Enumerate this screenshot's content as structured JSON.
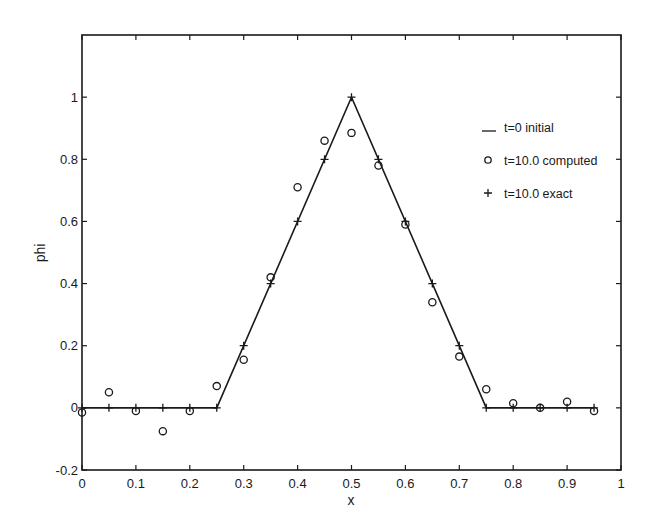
{
  "chart_data": {
    "type": "line",
    "title": "",
    "xlabel": "x",
    "ylabel": "phi",
    "xlim": [
      0,
      1
    ],
    "ylim": [
      -0.2,
      1.2
    ],
    "grid": false,
    "legend_position": "upper right (inside)",
    "x_ticks": [
      0,
      0.1,
      0.2,
      0.3,
      0.4,
      0.5,
      0.6,
      0.7,
      0.8,
      0.9,
      1
    ],
    "x_tick_labels": [
      "0",
      "0.1",
      "0.2",
      "0.3",
      "0.4",
      "0.5",
      "0.6",
      "0.7",
      "0.8",
      "0.9",
      "1"
    ],
    "y_ticks": [
      -0.2,
      0,
      0.2,
      0.4,
      0.6,
      0.8,
      1
    ],
    "y_tick_labels": [
      "-0.2",
      "0",
      "0.2",
      "0.4",
      "0.6",
      "0.8",
      "1"
    ],
    "series": [
      {
        "name": "t=0 initial",
        "style": "solid line",
        "x": [
          0,
          0.25,
          0.5,
          0.75,
          0.95
        ],
        "y": [
          0,
          0,
          1,
          0,
          0
        ]
      },
      {
        "name": "t=10.0 computed",
        "style": "circle markers",
        "x": [
          0,
          0.05,
          0.1,
          0.15,
          0.2,
          0.25,
          0.3,
          0.35,
          0.4,
          0.45,
          0.5,
          0.55,
          0.6,
          0.65,
          0.7,
          0.75,
          0.8,
          0.85,
          0.9,
          0.95
        ],
        "y": [
          -0.015,
          0.05,
          -0.01,
          -0.075,
          -0.01,
          0.07,
          0.155,
          0.42,
          0.71,
          0.86,
          0.885,
          0.78,
          0.59,
          0.34,
          0.165,
          0.06,
          0.015,
          0.0,
          0.02,
          -0.01
        ]
      },
      {
        "name": "t=10.0 exact",
        "style": "plus markers",
        "x": [
          0,
          0.05,
          0.1,
          0.15,
          0.2,
          0.25,
          0.3,
          0.35,
          0.4,
          0.45,
          0.5,
          0.55,
          0.6,
          0.65,
          0.7,
          0.75,
          0.8,
          0.85,
          0.9,
          0.95
        ],
        "y": [
          0,
          0,
          0,
          0,
          0,
          0,
          0.2,
          0.4,
          0.6,
          0.8,
          1.0,
          0.8,
          0.6,
          0.4,
          0.2,
          0,
          0,
          0,
          0,
          0
        ]
      }
    ],
    "legend": [
      {
        "symbol": "line",
        "label": "t=0 initial"
      },
      {
        "symbol": "o",
        "label": "t=10.0 computed"
      },
      {
        "symbol": "+",
        "label": "t=10.0 exact"
      }
    ]
  },
  "colors": {
    "ink": "#1a1a1a",
    "background": "#ffffff"
  }
}
